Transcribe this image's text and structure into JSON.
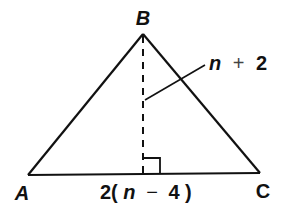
{
  "diagram": {
    "type": "triangle-with-altitude",
    "colors": {
      "stroke": "#111111",
      "background": "#ffffff"
    },
    "vertices": {
      "A": {
        "label": "A",
        "x": 28,
        "y": 175
      },
      "B": {
        "label": "B",
        "x": 143,
        "y": 34
      },
      "C": {
        "label": "C",
        "x": 260,
        "y": 173
      }
    },
    "altitude": {
      "from": "B",
      "style": "dashed",
      "right_angle_marker": true,
      "label": {
        "var": "n",
        "op": "+",
        "num": "2"
      }
    },
    "base": {
      "label": {
        "prefix": "2(",
        "var": "n",
        "op": "−",
        "num": "4",
        "suffix": ")"
      }
    }
  }
}
